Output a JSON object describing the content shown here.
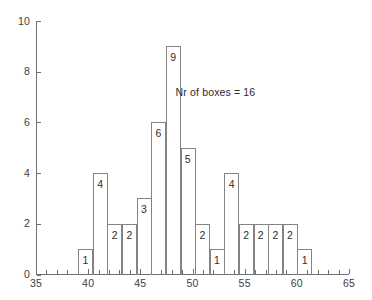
{
  "chart_data": {
    "type": "bar",
    "title": "",
    "subtitle": "",
    "xlabel": "",
    "ylabel": "",
    "xlim": [
      35,
      65
    ],
    "ylim": [
      0,
      10
    ],
    "grid": false,
    "legend": null,
    "annotations": [
      {
        "text": "Nr of boxes = 16",
        "x": 52.5,
        "y": 7.2
      }
    ],
    "x_ticks": [
      35,
      40,
      45,
      50,
      55,
      60,
      65
    ],
    "x_tick_labels": [
      "35",
      "40",
      "45",
      "50",
      "55",
      "60",
      "65"
    ],
    "x_minor_tick_step": 1,
    "y_ticks": [
      0,
      2,
      4,
      6,
      8,
      10
    ],
    "y_tick_labels": [
      "0",
      "2",
      "4",
      "6",
      "8",
      "10"
    ],
    "bin_edges": [
      39.05,
      40.45,
      41.85,
      43.25,
      44.65,
      46.05,
      47.45,
      48.85,
      50.25,
      51.65,
      53.05,
      54.45,
      55.85,
      57.25,
      58.65,
      60.05,
      61.45
    ],
    "categories": [
      "39.05-40.45",
      "40.45-41.85",
      "41.85-43.25",
      "43.25-44.65",
      "44.65-46.05",
      "46.05-47.45",
      "47.45-48.85",
      "48.85-50.25",
      "50.25-51.65",
      "51.65-53.05",
      "53.05-54.45",
      "54.45-55.85",
      "55.85-57.25",
      "57.25-58.65",
      "58.65-60.05",
      "60.05-61.45"
    ],
    "values": [
      1,
      4,
      2,
      2,
      3,
      6,
      9,
      5,
      2,
      1,
      4,
      2,
      2,
      2,
      2,
      1
    ],
    "bar_value_labels": [
      "1",
      "4",
      "2",
      "2",
      "3",
      "6",
      "9",
      "5",
      "2",
      "1",
      "4",
      "2",
      "2",
      "2",
      "2",
      "1"
    ],
    "total_count": 48,
    "colors": {
      "bar_edge": "#848484",
      "bar_fill": "transparent",
      "axis": "#6f6f6f",
      "text": "#2e2e2e",
      "background": "#ffffff"
    }
  }
}
